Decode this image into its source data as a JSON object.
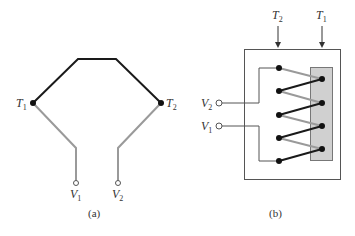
{
  "figure_a": {
    "caption": "(a)",
    "labels": {
      "t1": {
        "main": "T",
        "sub": "1"
      },
      "t2": {
        "main": "T",
        "sub": "2"
      },
      "v1": {
        "main": "V",
        "sub": "1"
      },
      "v2": {
        "main": "V",
        "sub": "2"
      }
    },
    "colors": {
      "wire_dark": "#1a1a1a",
      "wire_gray": "#9a9a9a"
    }
  },
  "figure_b": {
    "caption": "(b)",
    "labels": {
      "t2": {
        "main": "T",
        "sub": "2"
      },
      "t1": {
        "main": "T",
        "sub": "1"
      },
      "v2": {
        "main": "V",
        "sub": "2"
      },
      "v1": {
        "main": "V",
        "sub": "1"
      }
    },
    "colors": {
      "wire_dark": "#1a1a1a",
      "wire_gray": "#9a9a9a",
      "reference_block": "#d0d0d0"
    }
  }
}
